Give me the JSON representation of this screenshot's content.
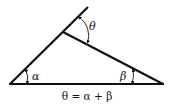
{
  "diagram": {
    "labels": {
      "theta": "θ",
      "alpha": "α",
      "beta": "β"
    },
    "formula": "θ = α + β",
    "colors": {
      "stroke": "#111111",
      "background": "#ffffff"
    }
  }
}
